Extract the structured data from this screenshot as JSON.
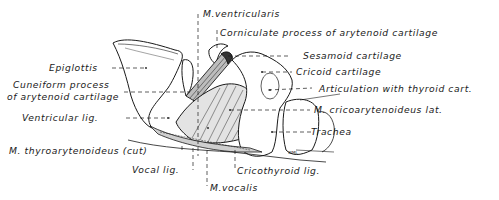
{
  "figure": {
    "signature": "WML",
    "ink_color": "#1a1a1a",
    "background": "#ffffff"
  },
  "labels": {
    "m_ventricularis": "M.ventricularis",
    "corniculate": "Corniculate process of arytenoid cartilage",
    "sesamoid": "Sesamoid cartilage",
    "epiglottis": "Epiglottis",
    "cricoid": "Cricoid cartilage",
    "cuneiform_1": "Cuneiform process",
    "cuneiform_2": "of arytenoid cartilage",
    "articulation": "Articulation with thyroid cart.",
    "ventricular_lig": "Ventricular lig.",
    "m_cricoarytenoideus": "M. cricoarytenoideus lat.",
    "trachea": "Trachea",
    "m_thyroarytenoideus": "M. thyroarytenoideus (cut)",
    "vocal_lig": "Vocal lig.",
    "cricothyroid_lig": "Cricothyroid lig.",
    "m_vocalis": "M.vocalis"
  }
}
